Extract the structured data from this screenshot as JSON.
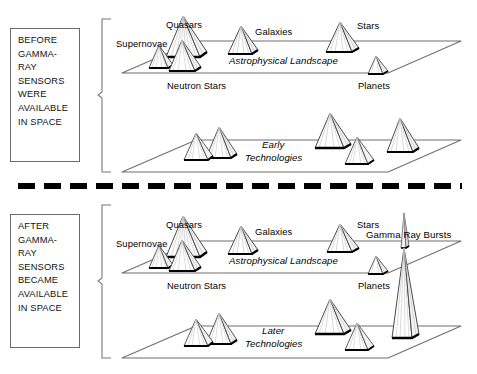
{
  "diagram": {
    "divider": "dashed-horizontal-rule"
  },
  "panels": {
    "before": {
      "caption_lines": [
        "BEFORE",
        "GAMMA-",
        "RAY",
        "SENSORS",
        "WERE",
        "AVAILABLE",
        "IN SPACE"
      ],
      "brace": "curly-brace-left",
      "landscapes": [
        {
          "name": "astrophysical-landscape-before",
          "plane_label": "Astrophysical Landscape",
          "peaks": [
            {
              "label": "Supernovae",
              "label_pos": "left"
            },
            {
              "label": "Quasars",
              "label_pos": "top"
            },
            {
              "label": "Neutron Stars",
              "label_pos": "bottom"
            },
            {
              "label": "Galaxies",
              "label_pos": "top"
            },
            {
              "label": "Stars",
              "label_pos": "top"
            },
            {
              "label": "Planets",
              "label_pos": "bottom"
            }
          ]
        },
        {
          "name": "early-technologies",
          "plane_label": "Early Technologies",
          "peaks": []
        }
      ]
    },
    "after": {
      "caption_lines": [
        "AFTER",
        "GAMMA-",
        "RAY",
        "SENSORS",
        "BECAME",
        "AVAILABLE",
        "IN SPACE"
      ],
      "brace": "curly-brace-left",
      "landscapes": [
        {
          "name": "astrophysical-landscape-after",
          "plane_label": "Astrophysical Landscape",
          "peaks": [
            {
              "label": "Supernovae",
              "label_pos": "left"
            },
            {
              "label": "Quasars",
              "label_pos": "top"
            },
            {
              "label": "Neutron Stars",
              "label_pos": "bottom"
            },
            {
              "label": "Galaxies",
              "label_pos": "top"
            },
            {
              "label": "Stars",
              "label_pos": "top"
            },
            {
              "label": "Planets",
              "label_pos": "bottom"
            },
            {
              "label": "Gamma  Ray  Bursts",
              "label_pos": "top"
            }
          ]
        },
        {
          "name": "later-technologies",
          "plane_label": "Later Technologies",
          "peaks": []
        }
      ]
    }
  },
  "labels": {
    "supernovae": "Supernovae",
    "quasars": "Quasars",
    "neutron_stars": "Neutron Stars",
    "galaxies": "Galaxies",
    "stars": "Stars",
    "planets": "Planets",
    "astrophysical_landscape": "Astrophysical Landscape",
    "early_technologies_l1": "Early",
    "early_technologies_l2": "Technologies",
    "later_technologies_l1": "Later",
    "later_technologies_l2": "Technologies",
    "gamma_ray_bursts": "Gamma  Ray  Bursts"
  },
  "colors": {
    "ink": "#000000",
    "plane_line": "#6f6f6f",
    "peak_outline": "#4a4a4a",
    "peak_interior": "#b9b9b9",
    "shadow": "#000000",
    "box_border": "#6a6a6a",
    "background": "#ffffff"
  }
}
